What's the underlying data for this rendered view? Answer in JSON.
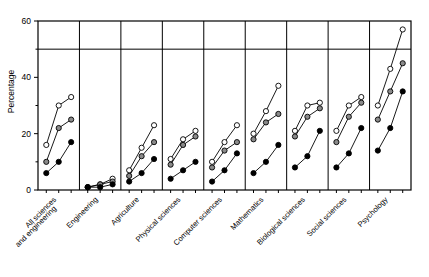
{
  "chart_data": {
    "type": "line",
    "title": "",
    "xlabel": "",
    "ylabel": "Percentage",
    "ylim": [
      0,
      60
    ],
    "yticks": [
      0,
      20,
      40,
      60
    ],
    "ytick_labels": [
      "0",
      "20",
      "40",
      "60"
    ],
    "grid": false,
    "reference_line": 50,
    "legend_position": "none",
    "panel_layout": "small-multiples",
    "categories": [
      "All sciences and engineering",
      "Engineering",
      "Agriculture",
      "Physical sciences",
      "Computer sciences",
      "Mathematics",
      "Biological sciences",
      "Social sciences",
      "Psychology"
    ],
    "series": [
      {
        "name": "series-open-circle",
        "marker": "open-circle",
        "values": [
          [
            16,
            30,
            33
          ],
          [
            1,
            2,
            4
          ],
          [
            7,
            15,
            23
          ],
          [
            11,
            18,
            21
          ],
          [
            10,
            17,
            23
          ],
          [
            20,
            28,
            37
          ],
          [
            21,
            30,
            31
          ],
          [
            21,
            30,
            33
          ],
          [
            30,
            43,
            57
          ]
        ]
      },
      {
        "name": "series-half-circle",
        "marker": "half-filled-circle",
        "values": [
          [
            10,
            22,
            25
          ],
          [
            1,
            2,
            3
          ],
          [
            5,
            12,
            17
          ],
          [
            9,
            16,
            19
          ],
          [
            8,
            14,
            17
          ],
          [
            18,
            24,
            27
          ],
          [
            19,
            26,
            29
          ],
          [
            17,
            26,
            31
          ],
          [
            25,
            35,
            45
          ]
        ]
      },
      {
        "name": "series-solid-circle",
        "marker": "solid-circle",
        "values": [
          [
            6,
            10,
            17
          ],
          [
            1,
            1,
            2
          ],
          [
            3,
            6,
            11
          ],
          [
            4,
            7,
            10
          ],
          [
            3,
            7,
            13
          ],
          [
            6,
            10,
            16
          ],
          [
            8,
            12,
            21
          ],
          [
            8,
            13,
            22
          ],
          [
            14,
            22,
            35
          ]
        ]
      }
    ]
  },
  "axis": {
    "ylabel": "Percentage",
    "ytick_labels": [
      "0",
      "20",
      "40",
      "60"
    ]
  }
}
